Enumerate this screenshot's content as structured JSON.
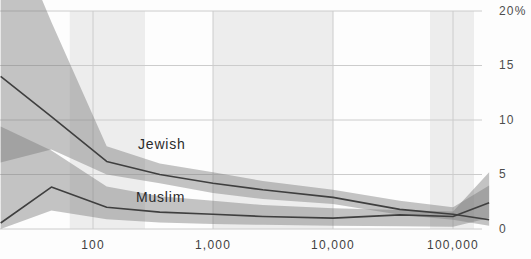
{
  "chart_data": {
    "type": "area",
    "title": "",
    "subtitle": "",
    "x_scale": "log",
    "xlabel": "",
    "ylabel": "",
    "xlim": [
      17,
      219000
    ],
    "ylim": [
      0,
      20
    ],
    "grid": true,
    "legend_position": "inline-labels",
    "x": [
      17,
      45,
      130,
      360,
      1000,
      2600,
      10000,
      36000,
      100000,
      200000
    ],
    "series": [
      {
        "name": "Jewish",
        "values": [
          14.0,
          10.3,
          6.2,
          5.0,
          4.2,
          3.6,
          2.9,
          1.8,
          1.35,
          0.85
        ],
        "ci_hi": [
          30.0,
          19.0,
          7.6,
          6.0,
          5.2,
          4.4,
          3.6,
          2.6,
          2.0,
          4.0
        ],
        "ci_lo": [
          6.1,
          7.3,
          5.0,
          4.2,
          3.3,
          2.75,
          2.3,
          1.3,
          0.85,
          0.3
        ]
      },
      {
        "name": "Muslim",
        "values": [
          0.55,
          3.85,
          2.0,
          1.55,
          1.35,
          1.15,
          1.0,
          1.3,
          1.15,
          2.4
        ],
        "ci_hi": [
          9.4,
          7.2,
          3.9,
          3.0,
          2.6,
          2.2,
          1.9,
          1.75,
          1.6,
          5.2
        ],
        "ci_lo": [
          0.0,
          1.7,
          0.9,
          0.6,
          0.45,
          0.38,
          0.3,
          0.25,
          0.2,
          1.0
        ]
      }
    ],
    "xticks": [
      {
        "value": 100,
        "label": "100"
      },
      {
        "value": 1000,
        "label": "1,000"
      },
      {
        "value": 10000,
        "label": "10,000"
      },
      {
        "value": 100000,
        "label": "100,000"
      }
    ],
    "yticks": [
      {
        "value": 20,
        "label": "20%"
      },
      {
        "value": 15,
        "label": "15"
      },
      {
        "value": 10,
        "label": "10"
      },
      {
        "value": 5,
        "label": "5"
      },
      {
        "value": 0,
        "label": "0"
      }
    ],
    "background_bands": [
      [
        64,
        271
      ],
      [
        1000,
        10000
      ],
      [
        64300,
        149700
      ]
    ],
    "colors": {
      "band": "#787878",
      "band_opacity": "0.44",
      "line": "#3f3f3f",
      "stripe": "#ededed",
      "grid": "#cccccc",
      "axis_text": "#4d4d4d",
      "series_label_text": "#2b2b2b",
      "background": "#fdfdfd"
    }
  }
}
